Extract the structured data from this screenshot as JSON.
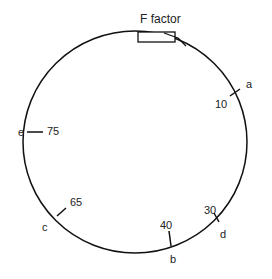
{
  "title": "F factor",
  "markers": [
    {
      "gene": "a",
      "minutes": "10"
    },
    {
      "gene": "d",
      "minutes": "30"
    },
    {
      "gene": "b",
      "minutes": "40"
    },
    {
      "gene": "c",
      "minutes": "65"
    },
    {
      "gene": "e",
      "minutes": "75"
    }
  ],
  "colors": {
    "stroke": "#111111",
    "text": "#222222"
  }
}
